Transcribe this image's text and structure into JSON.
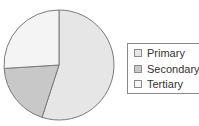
{
  "chart_data": {
    "type": "pie",
    "title": "",
    "categories": [
      "Primary",
      "Secondary",
      "Tertiary"
    ],
    "values": [
      55,
      19,
      26
    ],
    "unit": "percent (estimated from slice angles)",
    "start_angle_deg": 0,
    "direction": "clockwise",
    "colors": [
      "#e6e6e6",
      "#c8c8c8",
      "#f4f4f4"
    ],
    "stroke_color": "#7a7a7a",
    "legend_position": "right"
  },
  "legend": {
    "items": [
      {
        "label": "Primary",
        "color": "#e6e6e6"
      },
      {
        "label": "Secondary",
        "color": "#c8c8c8"
      },
      {
        "label": "Tertiary",
        "color": "#f4f4f4"
      }
    ]
  }
}
